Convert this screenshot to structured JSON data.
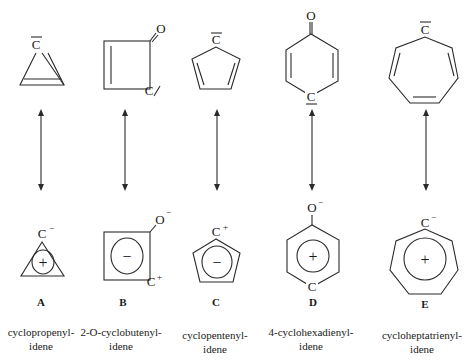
{
  "diagram": {
    "type": "resonance-structures",
    "compounds": [
      {
        "letter": "A",
        "name_line1": "cyclopropenyl-",
        "name_line2": "idene",
        "top": {
          "atom": "C",
          "lone_pair_mark": "overbar"
        },
        "bottom": {
          "atom": "C",
          "atom_charge": "−",
          "ring_sign": "+"
        }
      },
      {
        "letter": "B",
        "name_line1": "2-O-cyclobutenyl-",
        "name_line2": "idene",
        "top": {
          "atom": "C",
          "substituent": "O",
          "lone_pair_mark": "slash"
        },
        "bottom": {
          "atom": "C",
          "atom_charge": "+",
          "substituent": "O",
          "substituent_charge": "−",
          "ring_sign": "−"
        }
      },
      {
        "letter": "C",
        "name_line1": "cyclopentenyl-",
        "name_line2": "idene",
        "top": {
          "atom": "C",
          "lone_pair_mark": "overbar"
        },
        "bottom": {
          "atom": "C",
          "atom_charge": "+",
          "ring_sign": "−"
        }
      },
      {
        "letter": "D",
        "name_line1": "4-cyclohexadienyl-",
        "name_line2": "idene",
        "top": {
          "atom": "C",
          "substituent": "O",
          "lone_pair_mark": "underbar"
        },
        "bottom": {
          "atom": "C",
          "substituent": "O",
          "substituent_charge": "−",
          "ring_sign": "+"
        }
      },
      {
        "letter": "E",
        "name_line1": "cycloheptatrienyl-",
        "name_line2": "idene",
        "top": {
          "atom": "C",
          "lone_pair_mark": "overbar"
        },
        "bottom": {
          "atom": "C",
          "atom_charge": "−",
          "ring_sign": "+"
        }
      }
    ],
    "resonance_arrow": "double-headed"
  }
}
